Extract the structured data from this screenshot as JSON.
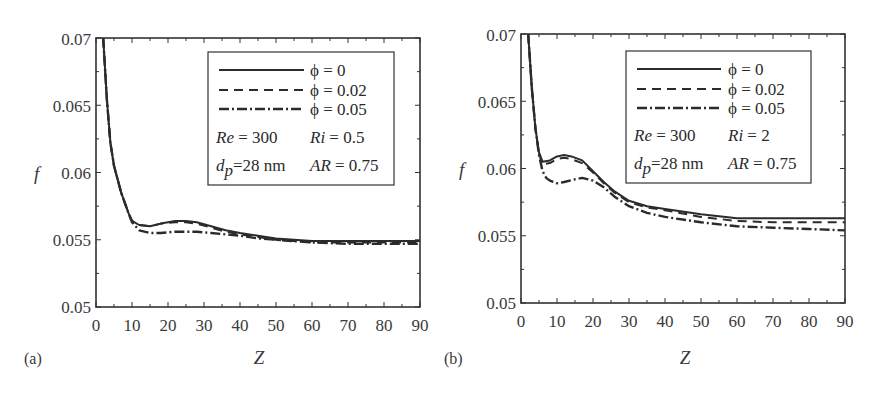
{
  "chart_data": [
    {
      "panel": "(a)",
      "type": "line",
      "title": "",
      "xlabel": "Z",
      "ylabel": "f",
      "xlim": [
        0,
        90
      ],
      "ylim": [
        0.05,
        0.07
      ],
      "xticks": [
        0,
        10,
        20,
        30,
        40,
        50,
        60,
        70,
        80,
        90
      ],
      "yticks": [
        0.05,
        0.055,
        0.06,
        0.065,
        0.07
      ],
      "ytick_labels": [
        "0.05",
        "0.055",
        "0.06",
        "0.065",
        "0.07"
      ],
      "grid": false,
      "legend_position": "upper right",
      "annotations": [
        "Re = 300",
        "Ri = 0.5",
        "d_p = 28 nm",
        "AR = 0.75"
      ],
      "series": [
        {
          "name": "φ = 0",
          "style": "solid",
          "x": [
            2,
            3,
            4,
            5,
            7,
            9,
            10,
            12,
            15,
            18,
            22,
            25,
            28,
            32,
            36,
            40,
            45,
            50,
            60,
            70,
            80,
            90
          ],
          "y": [
            0.07,
            0.0655,
            0.0622,
            0.0605,
            0.0585,
            0.057,
            0.0564,
            0.0561,
            0.056,
            0.0562,
            0.0564,
            0.0564,
            0.0563,
            0.056,
            0.0557,
            0.0555,
            0.0553,
            0.0551,
            0.0549,
            0.0549,
            0.0549,
            0.0549
          ]
        },
        {
          "name": "φ = 0.02",
          "style": "dashed",
          "x": [
            2,
            3,
            4,
            5,
            7,
            9,
            10,
            12,
            15,
            18,
            22,
            25,
            28,
            32,
            36,
            40,
            45,
            50,
            60,
            70,
            80,
            90
          ],
          "y": [
            0.07,
            0.0655,
            0.0622,
            0.0605,
            0.0585,
            0.057,
            0.0564,
            0.0561,
            0.056,
            0.0562,
            0.0563,
            0.0563,
            0.0562,
            0.0559,
            0.0556,
            0.0554,
            0.0552,
            0.055,
            0.0548,
            0.0548,
            0.0548,
            0.0548
          ]
        },
        {
          "name": "φ = 0.05",
          "style": "dashdot",
          "x": [
            2,
            3,
            4,
            5,
            7,
            9,
            10,
            12,
            15,
            18,
            22,
            25,
            28,
            32,
            36,
            40,
            45,
            50,
            60,
            70,
            80,
            90
          ],
          "y": [
            0.07,
            0.0655,
            0.0622,
            0.0605,
            0.0585,
            0.057,
            0.0563,
            0.0557,
            0.0555,
            0.0555,
            0.0556,
            0.0556,
            0.0556,
            0.0555,
            0.0554,
            0.0553,
            0.0551,
            0.055,
            0.0548,
            0.0547,
            0.0547,
            0.0547
          ]
        }
      ]
    },
    {
      "panel": "(b)",
      "type": "line",
      "title": "",
      "xlabel": "Z",
      "ylabel": "f",
      "xlim": [
        0,
        90
      ],
      "ylim": [
        0.05,
        0.07
      ],
      "xticks": [
        0,
        10,
        20,
        30,
        40,
        50,
        60,
        70,
        80,
        90
      ],
      "yticks": [
        0.05,
        0.055,
        0.06,
        0.065,
        0.07
      ],
      "ytick_labels": [
        "0.05",
        "0.055",
        "0.06",
        "0.065",
        "0.07"
      ],
      "grid": false,
      "legend_position": "upper right",
      "annotations": [
        "Re = 300",
        "Ri = 2",
        "d_p = 28 nm",
        "AR = 0.75"
      ],
      "series": [
        {
          "name": "φ = 0",
          "style": "solid",
          "x": [
            2,
            3,
            4,
            5,
            6,
            8,
            10,
            12,
            14,
            17,
            20,
            23,
            26,
            30,
            35,
            40,
            50,
            60,
            70,
            80,
            90
          ],
          "y": [
            0.07,
            0.066,
            0.063,
            0.0612,
            0.0605,
            0.0606,
            0.0609,
            0.061,
            0.0609,
            0.0606,
            0.0598,
            0.059,
            0.0583,
            0.0576,
            0.0572,
            0.057,
            0.0566,
            0.0563,
            0.0563,
            0.0563,
            0.0563
          ]
        },
        {
          "name": "φ = 0.02",
          "style": "dashed",
          "x": [
            2,
            3,
            4,
            5,
            6,
            8,
            10,
            12,
            14,
            17,
            20,
            23,
            26,
            30,
            35,
            40,
            50,
            60,
            70,
            80,
            90
          ],
          "y": [
            0.07,
            0.066,
            0.063,
            0.0611,
            0.0603,
            0.0604,
            0.0607,
            0.0608,
            0.0607,
            0.0604,
            0.0597,
            0.0589,
            0.0582,
            0.0575,
            0.0571,
            0.0569,
            0.0564,
            0.0561,
            0.056,
            0.056,
            0.056
          ]
        },
        {
          "name": "φ = 0.05",
          "style": "dashdot",
          "x": [
            2,
            3,
            4,
            5,
            6,
            7,
            8,
            10,
            12,
            15,
            17,
            20,
            23,
            26,
            30,
            35,
            40,
            50,
            60,
            70,
            80,
            90
          ],
          "y": [
            0.07,
            0.066,
            0.063,
            0.061,
            0.0598,
            0.0593,
            0.0591,
            0.0589,
            0.059,
            0.0592,
            0.0593,
            0.0591,
            0.0586,
            0.0579,
            0.0572,
            0.0567,
            0.0564,
            0.056,
            0.0557,
            0.0556,
            0.0555,
            0.0554
          ]
        }
      ]
    }
  ],
  "panels": [
    {
      "label": "(a)",
      "xlabel": "Z",
      "ylabel": "f",
      "xtick_labels": [
        "0",
        "10",
        "20",
        "30",
        "40",
        "50",
        "60",
        "70",
        "80",
        "90"
      ],
      "ytick_labels": [
        "0.05",
        "0.055",
        "0.06",
        "0.065",
        "0.07"
      ],
      "legend": {
        "entries": [
          "ϕ = 0",
          "ϕ = 0.02",
          "ϕ = 0.05"
        ],
        "re": "Re",
        "re_value": " = 300",
        "ri": "Ri",
        "ri_value": " = 0.5",
        "dp": "d",
        "dp_sub": "p",
        "dp_value": "=28 nm",
        "ar": "AR",
        "ar_value": " = 0.75"
      }
    },
    {
      "label": "(b)",
      "xlabel": "Z",
      "ylabel": "f",
      "xtick_labels": [
        "0",
        "10",
        "20",
        "30",
        "40",
        "50",
        "60",
        "70",
        "80",
        "90"
      ],
      "ytick_labels": [
        "0.05",
        "0.055",
        "0.06",
        "0.065",
        "0.07"
      ],
      "legend": {
        "entries": [
          "ϕ = 0",
          "ϕ = 0.02",
          "ϕ = 0.05"
        ],
        "re": "Re",
        "re_value": " = 300",
        "ri": "Ri",
        "ri_value": " = 2",
        "dp": "d",
        "dp_sub": "p",
        "dp_value": "=28 nm",
        "ar": "AR",
        "ar_value": " = 0.75"
      }
    }
  ],
  "colors": {
    "line": "#2b2b2b",
    "axis": "#333333",
    "text": "#3a3a3a"
  }
}
